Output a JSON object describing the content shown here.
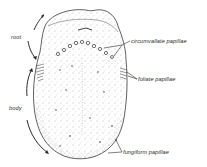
{
  "figure": {
    "labels": {
      "root": "root",
      "body": "body",
      "circumvallate": "circumvallate papillae",
      "foliate": "foliate papillae",
      "fungiform": "fungiform papillae"
    },
    "colors": {
      "ink": "#2a2a2a",
      "stipple": "#6a6a6a",
      "background": "#ffffff"
    }
  }
}
